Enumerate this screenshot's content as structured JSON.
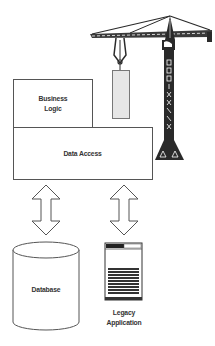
{
  "diagram": {
    "layers": {
      "business_logic": {
        "line1": "Business",
        "line2": "Logic"
      },
      "data_access": {
        "label": "Data Access"
      }
    },
    "datastores": {
      "database": {
        "label": "Database"
      },
      "legacy_application": {
        "line1": "Legacy",
        "line2": "Application"
      }
    },
    "connectors": [
      {
        "from": "Data Access",
        "to": "Database",
        "type": "bidirectional-arrow"
      },
      {
        "from": "Data Access",
        "to": "Legacy Application",
        "type": "bidirectional-arrow"
      }
    ],
    "decorations": {
      "crane": "crane-icon",
      "hanging_block": "block-icon"
    },
    "colors": {
      "stroke": "#555555",
      "crane": "#2a2a2a",
      "block_fill": "#e6e6e6"
    }
  }
}
